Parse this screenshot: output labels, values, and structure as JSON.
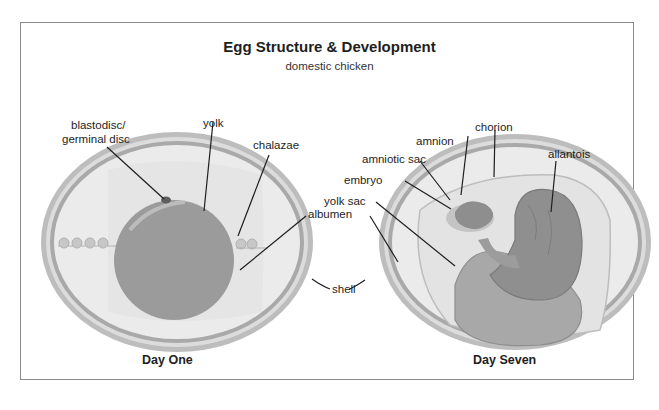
{
  "header": {
    "title": "Egg Structure & Development",
    "subtitle": "domestic chicken"
  },
  "panels": [
    {
      "caption": "Day One",
      "labels": {
        "blastodisc_1": "blastodisc/",
        "blastodisc_2": "germinal disc",
        "yolk": "yolk",
        "chalazae": "chalazae",
        "albumen": "albumen"
      }
    },
    {
      "caption": "Day Seven",
      "labels": {
        "amnion": "amnion",
        "chorion": "chorion",
        "amniotic_sac": "amniotic sac",
        "allantois": "allantois",
        "embryo": "embryo",
        "yolk_sac": "yolk sac"
      }
    }
  ],
  "shared_labels": {
    "shell": "shell"
  },
  "colors": {
    "shell": "#a9a9a9",
    "albumen": "#ececec",
    "yolk": "#9a9a9a",
    "blastodisc": "#6a6a6a",
    "leader_line": "#1e1e1e",
    "frame": "#8a8a8a"
  }
}
